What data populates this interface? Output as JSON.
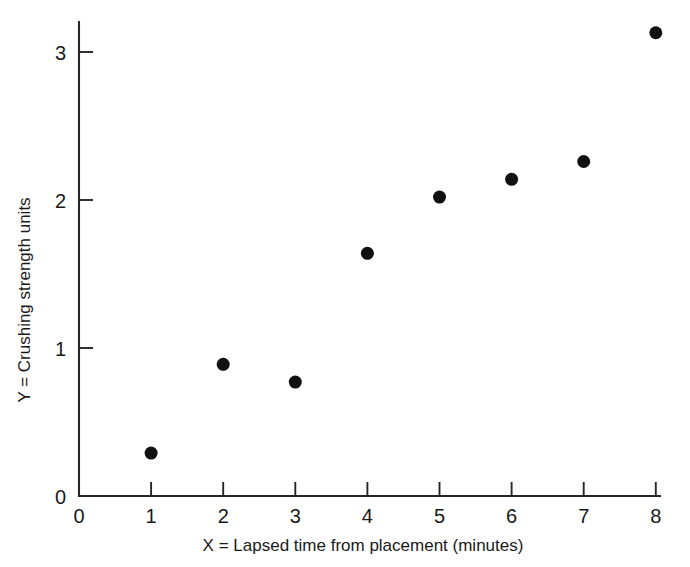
{
  "chart_data": {
    "type": "scatter",
    "title": "",
    "xlabel": "X = Lapsed time from placement (minutes)",
    "ylabel": "Y = Crushing strength units",
    "xlim": [
      0,
      8
    ],
    "ylim": [
      0,
      3.2
    ],
    "grid": false,
    "legend": false,
    "legend_position": "none",
    "xticks": [
      0,
      1,
      2,
      3,
      4,
      5,
      6,
      7,
      8
    ],
    "xtick_labels": [
      "0",
      "1",
      "2",
      "3",
      "4",
      "5",
      "6",
      "7",
      "8"
    ],
    "yticks": [
      1,
      2,
      3
    ],
    "ytick_labels": [
      "1",
      "2",
      "3"
    ],
    "y_origin_label": "0",
    "marker": "filled-circle",
    "marker_color": "#111111",
    "marker_size_px": 13,
    "x": [
      1,
      2,
      3,
      4,
      5,
      6,
      7,
      8
    ],
    "y": [
      0.29,
      0.89,
      0.77,
      1.64,
      2.02,
      2.14,
      2.26,
      3.13
    ],
    "points": [
      {
        "x": 1,
        "y": 0.29
      },
      {
        "x": 2,
        "y": 0.89
      },
      {
        "x": 3,
        "y": 0.77
      },
      {
        "x": 4,
        "y": 1.64
      },
      {
        "x": 5,
        "y": 2.02
      },
      {
        "x": 6,
        "y": 2.14
      },
      {
        "x": 7,
        "y": 2.26
      },
      {
        "x": 8,
        "y": 3.13
      }
    ]
  },
  "axes": {
    "x_title": "X = Lapsed time from placement (minutes)",
    "y_title": "Y = Crushing strength units",
    "origin_label": "0"
  },
  "colors": {
    "background": "#ffffff",
    "ink": "#262626",
    "marker": "#111111",
    "text": "#1a1a1a"
  }
}
